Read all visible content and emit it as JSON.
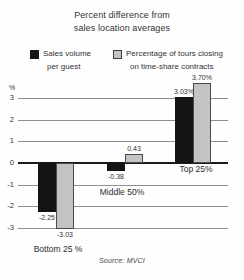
{
  "title": {
    "line1": "Percent difference from",
    "line2": "sales location averages"
  },
  "legend": {
    "items": [
      {
        "label_line1": "Sales volume",
        "label_line2": "per guest",
        "swatch": "black-square",
        "color": "#161616"
      },
      {
        "label_line1": "Percentage of tours closing",
        "label_line2": "on time-share contracts",
        "swatch": "gray-square",
        "color": "#c3c3c3"
      }
    ]
  },
  "source": "Source: MVCI",
  "chart_data": {
    "type": "bar",
    "title": "Percent difference from sales location averages",
    "categories": [
      "Bottom 25 %",
      "Middle 50%",
      "Top 25%"
    ],
    "series": [
      {
        "name": "Sales volume per guest",
        "color": "#141414",
        "border": "#141414",
        "values": [
          -2.25,
          -0.38,
          3.03
        ],
        "value_labels": [
          "-2.25",
          "-0.38",
          "3.03%"
        ]
      },
      {
        "name": "Percentage of tours closing on time-share contracts",
        "color": "#c3c3c3",
        "border": "#4a4a4a",
        "values": [
          -3.03,
          0.43,
          3.7
        ],
        "value_labels": [
          "-3.03",
          "0.43",
          "3.70%"
        ]
      }
    ],
    "xlabel": "",
    "ylabel": "%",
    "yticks": [
      3,
      2,
      1,
      0,
      -1,
      -2,
      -3
    ],
    "ylim": [
      -3.5,
      3.9
    ],
    "grid": true,
    "legend_position": "top",
    "source": "Source: MVCI"
  }
}
